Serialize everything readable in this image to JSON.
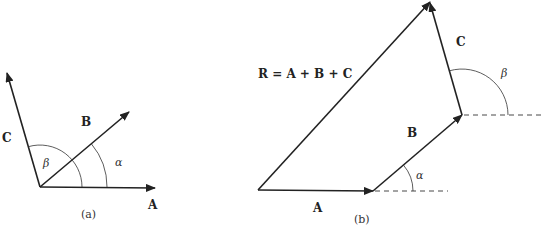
{
  "figure_a": {
    "caption": "(a)",
    "vectors": {
      "A": {
        "label": "A"
      },
      "B": {
        "label": "B"
      },
      "C": {
        "label": "C"
      }
    },
    "angles": {
      "alpha": {
        "label": "α"
      },
      "beta": {
        "label": "β"
      }
    }
  },
  "figure_b": {
    "caption": "(b)",
    "resultant_equation": "R = A + B + C",
    "vectors": {
      "A": {
        "label": "A"
      },
      "B": {
        "label": "B"
      },
      "C": {
        "label": "C"
      }
    },
    "angles": {
      "alpha": {
        "label": "α"
      },
      "beta": {
        "label": "β"
      }
    }
  },
  "colors": {
    "line": "#222222",
    "background": "#ffffff"
  }
}
